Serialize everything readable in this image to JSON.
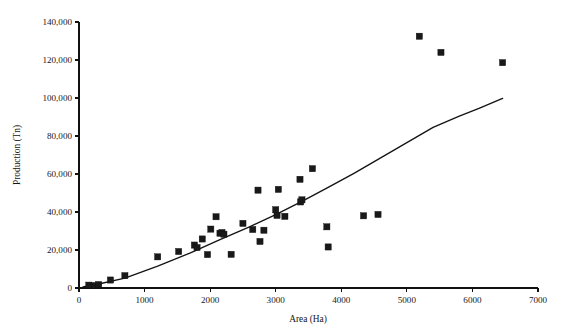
{
  "chart_data": {
    "type": "scatter",
    "title": "",
    "xlabel": "Area (Ha)",
    "ylabel": "Production (Tn)",
    "xlim": [
      0,
      7000
    ],
    "ylim": [
      0,
      140000
    ],
    "xticks": [
      0,
      1000,
      2000,
      3000,
      4000,
      5000,
      6000,
      7000
    ],
    "yticks": [
      0,
      20000,
      40000,
      60000,
      80000,
      100000,
      120000,
      140000
    ],
    "xtick_labels": [
      "0",
      "1000",
      "2000",
      "3000",
      "4000",
      "5000",
      "6000",
      "7000"
    ],
    "ytick_labels": [
      "0",
      "20,000",
      "40,000",
      "60,000",
      "80,000",
      "100,000",
      "120,000",
      "140,000"
    ],
    "grid": false,
    "legend": null,
    "marker": "square",
    "marker_color": "#191919",
    "line_color": "#141414",
    "series": [
      {
        "name": "Area vs Production",
        "type": "scatter",
        "points": [
          [
            150,
            1500
          ],
          [
            240,
            1300
          ],
          [
            300,
            1800
          ],
          [
            480,
            4200
          ],
          [
            700,
            6500
          ],
          [
            1200,
            16400
          ],
          [
            1520,
            19200
          ],
          [
            1760,
            22600
          ],
          [
            1800,
            21300
          ],
          [
            1880,
            25800
          ],
          [
            1960,
            17600
          ],
          [
            2010,
            31000
          ],
          [
            2090,
            37500
          ],
          [
            2150,
            28800
          ],
          [
            2180,
            29200
          ],
          [
            2210,
            28300
          ],
          [
            2320,
            17700
          ],
          [
            2500,
            34000
          ],
          [
            2650,
            30800
          ],
          [
            2730,
            51500
          ],
          [
            2760,
            24500
          ],
          [
            2820,
            30400
          ],
          [
            3000,
            41200
          ],
          [
            3020,
            38200
          ],
          [
            3040,
            51900
          ],
          [
            3140,
            37700
          ],
          [
            3370,
            57200
          ],
          [
            3380,
            45300
          ],
          [
            3400,
            46400
          ],
          [
            3560,
            62800
          ],
          [
            3780,
            32200
          ],
          [
            3800,
            21600
          ],
          [
            4340,
            38000
          ],
          [
            4560,
            38700
          ],
          [
            5190,
            132500
          ],
          [
            5520,
            124000
          ],
          [
            6460,
            118600
          ]
        ]
      },
      {
        "name": "Trend line",
        "type": "line",
        "points": [
          [
            60,
            600
          ],
          [
            300,
            2100
          ],
          [
            700,
            5200
          ],
          [
            1200,
            11500
          ],
          [
            1700,
            18500
          ],
          [
            2150,
            25500
          ],
          [
            2600,
            32200
          ],
          [
            3000,
            38600
          ],
          [
            3400,
            45600
          ],
          [
            3800,
            53000
          ],
          [
            4200,
            60500
          ],
          [
            4600,
            68500
          ],
          [
            5000,
            76500
          ],
          [
            5400,
            84500
          ],
          [
            5800,
            90500
          ],
          [
            6100,
            94500
          ],
          [
            6460,
            99800
          ]
        ]
      }
    ]
  },
  "axes": {
    "x_title": "Area (Ha)",
    "y_title": "Production (Tn)"
  }
}
